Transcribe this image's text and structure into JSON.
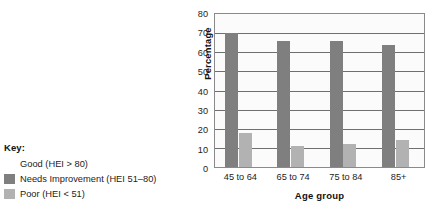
{
  "legend": {
    "title": "Key:",
    "items": [
      {
        "label": "Good (HEI > 80)",
        "color": "#ffffff",
        "swatch_visible": false
      },
      {
        "label": "Needs Improvement (HEI 51–80)",
        "color": "#7f7f7f",
        "swatch_visible": true
      },
      {
        "label": "Poor (HEI < 51)",
        "color": "#b2b2b2",
        "swatch_visible": true
      }
    ]
  },
  "chart_data": {
    "type": "bar",
    "title": "",
    "xlabel": "Age group",
    "ylabel": "Percentage",
    "categories": [
      "45 to 64",
      "65 to 74",
      "75 to 84",
      "85+"
    ],
    "series": [
      {
        "name": "Good (HEI > 80)",
        "color": "#ffffff",
        "values": [
          0,
          0,
          0,
          0
        ]
      },
      {
        "name": "Needs Improvement (HEI 51–80)",
        "color": "#7f7f7f",
        "values": [
          70,
          66,
          66,
          64
        ]
      },
      {
        "name": "Poor (HEI < 51)",
        "color": "#b2b2b2",
        "values": [
          18,
          11,
          12,
          14
        ]
      }
    ],
    "ylim": [
      0,
      80
    ],
    "yticks": [
      0,
      10,
      20,
      30,
      40,
      50,
      60,
      70,
      80
    ],
    "ytick_labels": [
      "0",
      "10",
      "20",
      "30",
      "40",
      "50",
      "60",
      "70",
      "80"
    ],
    "grid": true,
    "legend_position": "left-outside"
  }
}
